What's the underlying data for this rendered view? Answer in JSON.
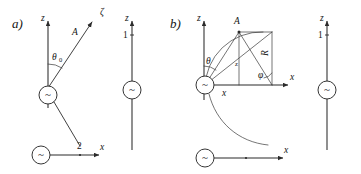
{
  "figure": {
    "background_color": "#ffffff",
    "ink_color": "#2b2b2b",
    "panels": [
      {
        "id": "a",
        "label": "a)",
        "axis_z": "z",
        "axis_x": "x",
        "ray_tip_label": "ζ",
        "ray_label": "A",
        "angle_label": "θ",
        "angle_subscript": "0",
        "tick_label": "2",
        "source_symbol": "~"
      },
      {
        "id": "a-right",
        "label": "",
        "axis_z": "z",
        "tick_label": "1",
        "source_symbol": "~"
      },
      {
        "id": "b",
        "label": "b)",
        "axis_z": "z",
        "axis_x": "x",
        "point_label": "A",
        "angle_theta": "θ",
        "angle_phi": "φ",
        "radius_label": "R",
        "height_label": "z",
        "base_label": "x",
        "source_symbol": "~",
        "lower_axis_x": "x"
      },
      {
        "id": "b-right",
        "label": "",
        "axis_z": "z",
        "tick_label": "1",
        "source_symbol": "~"
      }
    ]
  }
}
